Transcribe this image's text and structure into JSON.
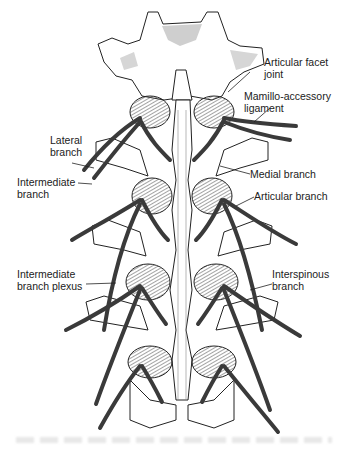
{
  "figure": {
    "type": "anatomical-illustration",
    "colors": {
      "nerve": "#3a3a3a",
      "bone_outline": "#222222",
      "bone_fill": "#ffffff",
      "cartilage_shade": "#c8c8c8",
      "ligament_hatch": "#555555"
    },
    "labels": {
      "articular_facet_joint": {
        "line1": "Articular facet",
        "line2": "joint"
      },
      "mamillo_accessory_ligament": {
        "line1": "Mamillo-accessory",
        "line2": "ligament"
      },
      "lateral_branch": {
        "line1": "Lateral",
        "line2": "branch"
      },
      "intermediate_branch": {
        "line1": "Intermediate",
        "line2": "branch"
      },
      "medial_branch": {
        "line1": "Medial branch"
      },
      "articular_branch": {
        "line1": "Articular branch"
      },
      "intermediate_branch_plexus": {
        "line1": "Intermediate",
        "line2": "branch plexus"
      },
      "interspinous_branch": {
        "line1": "Interspinous",
        "line2": "branch"
      }
    }
  }
}
